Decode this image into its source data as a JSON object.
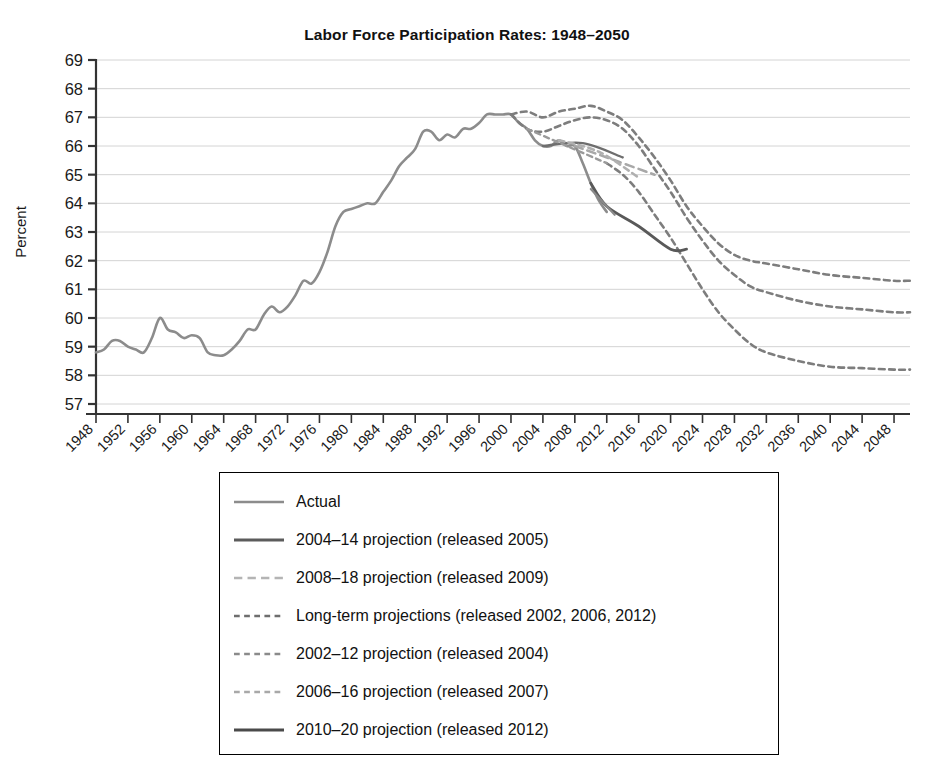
{
  "chart_data": {
    "type": "line",
    "title": "Labor Force Participation Rates: 1948–2050",
    "xlabel": "",
    "ylabel": "Percent",
    "ylim": [
      57,
      69
    ],
    "xlim": [
      1948,
      2050
    ],
    "grid": true,
    "legend_position": "below",
    "ytick_labels": [
      "69",
      "68",
      "67",
      "66",
      "65",
      "64",
      "63",
      "62",
      "61",
      "60",
      "59",
      "58",
      "57"
    ],
    "xtick_labels": [
      "1948",
      "1952",
      "1956",
      "1960",
      "1964",
      "1968",
      "1972",
      "1976",
      "1980",
      "1984",
      "1988",
      "1992",
      "1996",
      "2000",
      "2004",
      "2008",
      "2012",
      "2016",
      "2020",
      "2024",
      "2028",
      "2032",
      "2036",
      "2040",
      "2044",
      "2048"
    ],
    "series": [
      {
        "name": "Actual",
        "style": "solid",
        "color": "#8c8c8c",
        "width": 2.6,
        "points": [
          [
            1948,
            58.8
          ],
          [
            1949,
            58.9
          ],
          [
            1950,
            59.2
          ],
          [
            1951,
            59.2
          ],
          [
            1952,
            59.0
          ],
          [
            1953,
            58.9
          ],
          [
            1954,
            58.8
          ],
          [
            1955,
            59.3
          ],
          [
            1956,
            60.0
          ],
          [
            1957,
            59.6
          ],
          [
            1958,
            59.5
          ],
          [
            1959,
            59.3
          ],
          [
            1960,
            59.4
          ],
          [
            1961,
            59.3
          ],
          [
            1962,
            58.8
          ],
          [
            1963,
            58.7
          ],
          [
            1964,
            58.7
          ],
          [
            1965,
            58.9
          ],
          [
            1966,
            59.2
          ],
          [
            1967,
            59.6
          ],
          [
            1968,
            59.6
          ],
          [
            1969,
            60.1
          ],
          [
            1970,
            60.4
          ],
          [
            1971,
            60.2
          ],
          [
            1972,
            60.4
          ],
          [
            1973,
            60.8
          ],
          [
            1974,
            61.3
          ],
          [
            1975,
            61.2
          ],
          [
            1976,
            61.6
          ],
          [
            1977,
            62.3
          ],
          [
            1978,
            63.2
          ],
          [
            1979,
            63.7
          ],
          [
            1980,
            63.8
          ],
          [
            1981,
            63.9
          ],
          [
            1982,
            64.0
          ],
          [
            1983,
            64.0
          ],
          [
            1984,
            64.4
          ],
          [
            1985,
            64.8
          ],
          [
            1986,
            65.3
          ],
          [
            1987,
            65.6
          ],
          [
            1988,
            65.9
          ],
          [
            1989,
            66.5
          ],
          [
            1990,
            66.5
          ],
          [
            1991,
            66.2
          ],
          [
            1992,
            66.4
          ],
          [
            1993,
            66.3
          ],
          [
            1994,
            66.6
          ],
          [
            1995,
            66.6
          ],
          [
            1996,
            66.8
          ],
          [
            1997,
            67.1
          ],
          [
            1998,
            67.1
          ],
          [
            1999,
            67.1
          ],
          [
            2000,
            67.1
          ],
          [
            2001,
            66.8
          ],
          [
            2002,
            66.6
          ],
          [
            2003,
            66.2
          ],
          [
            2004,
            66.0
          ],
          [
            2005,
            66.0
          ],
          [
            2006,
            66.2
          ],
          [
            2007,
            66.0
          ],
          [
            2008,
            66.0
          ],
          [
            2009,
            65.4
          ],
          [
            2010,
            64.7
          ],
          [
            2011,
            64.1
          ],
          [
            2012,
            63.7
          ]
        ]
      },
      {
        "name": "2004–14 projection (released 2005)",
        "style": "solid",
        "color": "#6e6e6e",
        "width": 2.4,
        "points": [
          [
            2004,
            66.0
          ],
          [
            2009,
            66.1
          ],
          [
            2014,
            65.6
          ]
        ]
      },
      {
        "name": "2008–18 projection (released 2009)",
        "style": "dashed",
        "color": "#a8a8a8",
        "width": 2.6,
        "points": [
          [
            2008,
            66.0
          ],
          [
            2013,
            65.5
          ],
          [
            2018,
            65.0
          ]
        ]
      },
      {
        "name": "Long-term projections (released 2002, 2006, 2012)",
        "style": "dotted",
        "color": "#7d7d7d",
        "width": 2.6,
        "points": [
          [
            2000,
            67.1
          ],
          [
            2002,
            67.2
          ],
          [
            2004,
            67.0
          ],
          [
            2006,
            67.2
          ],
          [
            2008,
            67.3
          ],
          [
            2010,
            67.4
          ],
          [
            2012,
            67.2
          ],
          [
            2014,
            66.9
          ],
          [
            2016,
            66.3
          ],
          [
            2018,
            65.6
          ],
          [
            2020,
            64.8
          ],
          [
            2022,
            63.9
          ],
          [
            2024,
            63.2
          ],
          [
            2026,
            62.6
          ],
          [
            2028,
            62.2
          ],
          [
            2030,
            62.0
          ],
          [
            2032,
            61.9
          ],
          [
            2036,
            61.7
          ],
          [
            2040,
            61.5
          ],
          [
            2044,
            61.4
          ],
          [
            2048,
            61.3
          ],
          [
            2050,
            61.3
          ]
        ]
      },
      {
        "name": "Long-term projections (released 2002, 2006, 2012) b",
        "style": "dotted",
        "color": "#7d7d7d",
        "width": 2.6,
        "points": [
          [
            2000,
            67.1
          ],
          [
            2002,
            66.6
          ],
          [
            2004,
            66.5
          ],
          [
            2006,
            66.7
          ],
          [
            2008,
            66.9
          ],
          [
            2010,
            67.0
          ],
          [
            2012,
            66.9
          ],
          [
            2014,
            66.6
          ],
          [
            2016,
            66.0
          ],
          [
            2018,
            65.2
          ],
          [
            2020,
            64.4
          ],
          [
            2022,
            63.5
          ],
          [
            2024,
            62.7
          ],
          [
            2026,
            62.0
          ],
          [
            2028,
            61.5
          ],
          [
            2030,
            61.1
          ],
          [
            2032,
            60.9
          ],
          [
            2036,
            60.6
          ],
          [
            2040,
            60.4
          ],
          [
            2044,
            60.3
          ],
          [
            2048,
            60.2
          ],
          [
            2050,
            60.2
          ]
        ]
      },
      {
        "name": "Long-term projections (released 2002, 2006, 2012) c",
        "style": "dotted",
        "color": "#7d7d7d",
        "width": 2.6,
        "points": [
          [
            2012,
            65.4
          ],
          [
            2014,
            65.0
          ],
          [
            2016,
            64.4
          ],
          [
            2018,
            63.6
          ],
          [
            2020,
            62.8
          ],
          [
            2022,
            61.9
          ],
          [
            2024,
            61.0
          ],
          [
            2026,
            60.2
          ],
          [
            2028,
            59.6
          ],
          [
            2030,
            59.1
          ],
          [
            2032,
            58.8
          ],
          [
            2036,
            58.5
          ],
          [
            2040,
            58.3
          ],
          [
            2044,
            58.25
          ],
          [
            2048,
            58.2
          ],
          [
            2050,
            58.2
          ]
        ]
      },
      {
        "name": "2002–12 projection (released 2004)",
        "style": "dotted",
        "color": "#9a9a9a",
        "width": 2.4,
        "points": [
          [
            2002,
            66.6
          ],
          [
            2007,
            66.0
          ],
          [
            2012,
            65.4
          ]
        ]
      },
      {
        "name": "2006–16 projection (released 2007)",
        "style": "dotted",
        "color": "#b0b0b0",
        "width": 2.6,
        "points": [
          [
            2006,
            66.2
          ],
          [
            2011,
            65.8
          ],
          [
            2016,
            64.9
          ]
        ]
      },
      {
        "name": "2010–20 projection (released 2012)",
        "style": "solid",
        "color": "#595959",
        "width": 2.8,
        "points": [
          [
            2010,
            64.7
          ],
          [
            2012,
            63.9
          ],
          [
            2016,
            63.2
          ],
          [
            2020,
            62.4
          ],
          [
            2022,
            62.4
          ]
        ]
      },
      {
        "name": "short-spur",
        "style": "solid",
        "color": "#8a8a8a",
        "width": 2.2,
        "points": [
          [
            2010,
            64.5
          ],
          [
            2013,
            63.6
          ]
        ]
      }
    ]
  },
  "legend": {
    "items": [
      {
        "label": "Actual",
        "style": "solid",
        "color": "#8c8c8c",
        "width": 2.4
      },
      {
        "label": "2004–14 projection (released 2005)",
        "style": "solid",
        "color": "#5c5c5c",
        "width": 3.0
      },
      {
        "label": "2008–18 projection (released 2009)",
        "style": "dashed",
        "color": "#b4b4b4",
        "width": 2.6
      },
      {
        "label": "Long-term projections (released 2002, 2006, 2012)",
        "style": "dotted",
        "color": "#6e6e6e",
        "width": 2.6
      },
      {
        "label": "2002–12 projection (released 2004)",
        "style": "dotted",
        "color": "#8a8a8a",
        "width": 2.6
      },
      {
        "label": "2006–16 projection (released 2007)",
        "style": "dotted",
        "color": "#a8a8a8",
        "width": 2.6
      },
      {
        "label": "2010–20 projection (released 2012)",
        "style": "solid",
        "color": "#4a4a4a",
        "width": 3.0
      }
    ]
  }
}
